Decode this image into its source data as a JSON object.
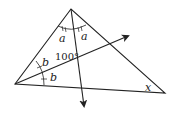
{
  "diagram": {
    "type": "triangle-with-angle-bisectors",
    "vertices": {
      "apex": [
        71,
        9
      ],
      "left": [
        15,
        84
      ],
      "right": [
        165,
        93
      ]
    },
    "bisectors": [
      {
        "from": "apex",
        "arrow_tip": [
          84,
          108
        ]
      },
      {
        "from": "left",
        "arrow_tip": [
          130,
          35
        ]
      }
    ],
    "labels": {
      "apex_left_angle": "a",
      "apex_right_angle": "a",
      "left_upper_angle": "b",
      "left_lower_angle": "b",
      "intersection_angle": "100°",
      "right_vertex_angle": "x"
    },
    "colors": {
      "stroke": "#222222",
      "background": "#ffffff"
    }
  }
}
